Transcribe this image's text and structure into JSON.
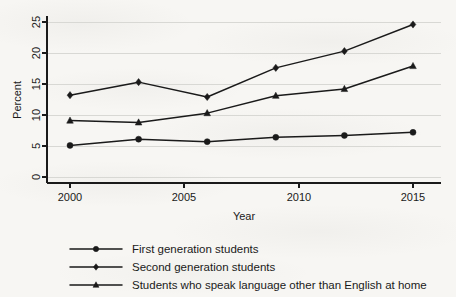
{
  "chart_data": {
    "type": "line",
    "title": "",
    "xlabel": "Year",
    "ylabel": "Percent",
    "x": [
      2000,
      2003,
      2006,
      2009,
      2012,
      2015
    ],
    "xlim": [
      1999,
      2016
    ],
    "ylim": [
      0,
      26
    ],
    "xticks": [
      2000,
      2005,
      2010,
      2015
    ],
    "xtick_labels": [
      "2000",
      "2005",
      "2010",
      "2015"
    ],
    "yticks": [
      0,
      5,
      10,
      15,
      20,
      25
    ],
    "ytick_labels": [
      "0",
      "5",
      "10",
      "15",
      "20",
      "25"
    ],
    "grid": "horizontal",
    "legend_position": "below",
    "series": [
      {
        "name": "First generation students",
        "marker": "circle",
        "color": "#1a1a1a",
        "values": [
          5.1,
          6.1,
          5.7,
          6.4,
          6.7,
          7.2
        ]
      },
      {
        "name": "Second generation students",
        "marker": "diamond",
        "color": "#1a1a1a",
        "values": [
          13.2,
          15.3,
          12.9,
          17.6,
          20.3,
          24.6
        ]
      },
      {
        "name": "Students who speak language other than English at home",
        "marker": "triangle",
        "color": "#1a1a1a",
        "values": [
          9.1,
          8.8,
          10.3,
          13.1,
          14.2,
          17.9
        ]
      }
    ]
  },
  "axes": {
    "ylabel": "Percent",
    "xlabel": "Year"
  },
  "legend": {
    "items": [
      {
        "label": "First generation students",
        "marker": "circle-marker"
      },
      {
        "label": "Second generation students",
        "marker": "diamond-marker"
      },
      {
        "label": "Students who speak language other than English at home",
        "marker": "triangle-marker"
      }
    ]
  }
}
